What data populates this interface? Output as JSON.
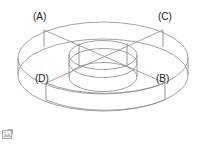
{
  "figure": {
    "shape_type": "annulus-solid-3d-wireframe",
    "view": "isometric-perspective",
    "background_color": "#ffffff",
    "line_color": "#8a8a8a",
    "label_color": "#1a1a1a",
    "labels": [
      {
        "id": "A",
        "text": "(A)",
        "position": "top-left"
      },
      {
        "id": "C",
        "text": "(C)",
        "position": "top-right"
      },
      {
        "id": "D",
        "text": "(D)",
        "position": "bottom-left"
      },
      {
        "id": "B",
        "text": "(B)",
        "position": "bottom-right"
      }
    ],
    "chords": [
      {
        "from": "A",
        "to": "B"
      },
      {
        "from": "C",
        "to": "D"
      }
    ]
  },
  "artifacts": {
    "broken_image_icon_name": "broken-image-icon"
  }
}
